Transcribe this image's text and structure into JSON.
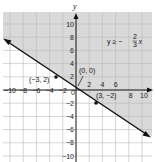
{
  "chart_data": {
    "type": "line",
    "title": "",
    "xlabel": "x",
    "ylabel": "y",
    "xlim": [
      -11,
      11
    ],
    "ylim": [
      -11,
      11
    ],
    "grid": true,
    "grid_step": 2,
    "x_ticks": [
      "-10",
      "-8",
      "-6",
      "-4",
      "-2",
      "0",
      "2",
      "4",
      "6",
      "8",
      "10"
    ],
    "y_ticks": [
      "10",
      "8",
      "6",
      "4",
      "2",
      "-2",
      "-4",
      "-6",
      "-8",
      "-10"
    ],
    "inequality_label": "y ≥ −2/3 x",
    "boundary_line": {
      "slope": -0.6667,
      "intercept": 0,
      "style": "solid",
      "arrows": "both"
    },
    "shaded_region": "above",
    "shade_color": "#d9d9d9",
    "points": [
      {
        "x": -3,
        "y": 2,
        "label": "(−3, 2)"
      },
      {
        "x": 0,
        "y": 0,
        "label": "(0, 0)"
      },
      {
        "x": 3,
        "y": -2,
        "label": "(3, −2)"
      }
    ],
    "series": [
      {
        "name": "y = -2/3 x",
        "x": [
          -11,
          -3,
          0,
          3,
          11
        ],
        "y": [
          7.33,
          2,
          0,
          -2,
          -7.33
        ]
      }
    ]
  },
  "labels": {
    "y_axis": "y",
    "inequality": {
      "lhs": "y ≥ −",
      "num": "2",
      "den": "3",
      "var": "x"
    },
    "point_a": "(−3, 2)",
    "point_b": "(0, 0)",
    "point_c": "(3, −2)",
    "origin": "0"
  },
  "colors": {
    "shade": "#d9d9d9",
    "grid": "#bdbdbd",
    "line": "#111111",
    "background": "#ffffff"
  }
}
